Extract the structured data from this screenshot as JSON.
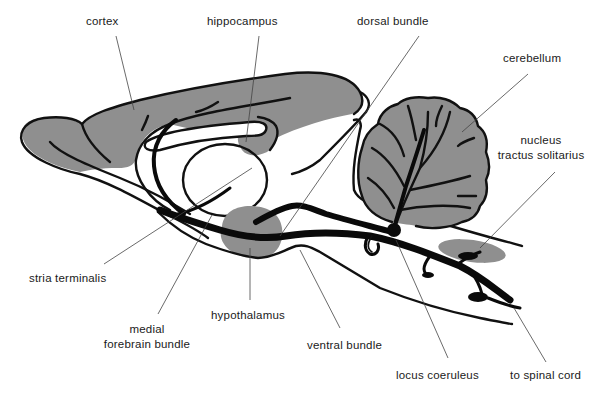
{
  "diagram": {
    "colors": {
      "background": "#ffffff",
      "region_fill": "#8f8f8f",
      "outline": "#111111",
      "pathway": "#0a0a0a",
      "leader_line": "#444444"
    },
    "labels": {
      "cortex": "cortex",
      "hippocampus": "hippocampus",
      "dorsal_bundle": "dorsal bundle",
      "cerebellum": "cerebellum",
      "nucleus_line1": "nucleus",
      "nucleus_line2": "tractus solitarius",
      "stria_terminalis": "stria terminalis",
      "hypothalamus": "hypothalamus",
      "mfb_line1": "medial",
      "mfb_line2": "forebrain bundle",
      "ventral_bundle": "ventral bundle",
      "locus_coeruleus": "locus coeruleus",
      "spinal_cord": "to spinal cord"
    },
    "regions": [
      {
        "name": "cortex",
        "shaded": true
      },
      {
        "name": "hippocampus",
        "shaded": true
      },
      {
        "name": "thalamus",
        "shaded": false
      },
      {
        "name": "hypothalamus",
        "shaded": true
      },
      {
        "name": "cerebellum",
        "shaded": true
      },
      {
        "name": "nucleus tractus solitarius",
        "shaded": true
      },
      {
        "name": "locus coeruleus",
        "shaded": false
      }
    ]
  }
}
